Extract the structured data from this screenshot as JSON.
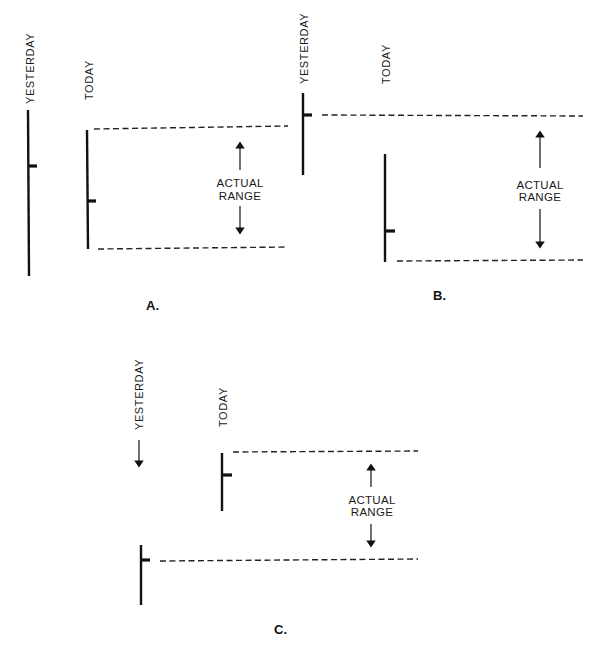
{
  "diagram": {
    "labels": {
      "yesterday": "YESTERDAY",
      "today": "TODAY",
      "actual": "ACTUAL",
      "range": "RANGE"
    },
    "panels": [
      {
        "id": "A",
        "caption": "A.",
        "yesterday_bar": {
          "x": 29,
          "y1": 110,
          "y2": 276,
          "close_tick_y": 166
        },
        "today_bar": {
          "x": 88,
          "y1": 130,
          "y2": 249,
          "close_tick_y": 201
        },
        "range_lines": {
          "top_y": 128,
          "bottom_y": 247
        }
      },
      {
        "id": "B",
        "caption": "B.",
        "yesterday_bar": {
          "x": 303,
          "y1": 93,
          "y2": 175,
          "close_tick_y": 115
        },
        "today_bar": {
          "x": 385,
          "y1": 154,
          "y2": 262,
          "close_tick_y": 231
        },
        "range_lines": {
          "top_y": 115,
          "bottom_y": 261
        }
      },
      {
        "id": "C",
        "caption": "C.",
        "yesterday_bar": {
          "x": 141,
          "y1": 545,
          "y2": 605,
          "close_tick_y": 560
        },
        "today_bar": {
          "x": 222,
          "y1": 453,
          "y2": 511,
          "close_tick_y": 475
        },
        "range_lines": {
          "top_y": 452,
          "bottom_y": 560
        },
        "yesterday_arrow": "down"
      }
    ]
  }
}
